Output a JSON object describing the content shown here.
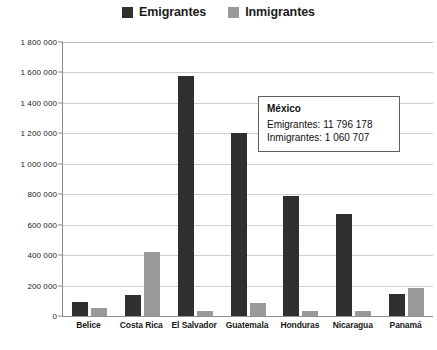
{
  "legend": {
    "position": "top-center",
    "entries": [
      {
        "label": "Emigrantes",
        "color": "#2f2f2f",
        "swatch_name": "legend-swatch-emigrantes"
      },
      {
        "label": "Inmigrantes",
        "color": "#9a9a9a",
        "swatch_name": "legend-swatch-inmigrantes"
      }
    ]
  },
  "annotation": {
    "title": "México",
    "emigrantes": "Emigrantes: 11 796 178",
    "inmigrantes": "Inmigrantes: 1 060 707"
  },
  "axis": {
    "ticks": [
      "1 800 000",
      "1 600 000",
      "1 400 000",
      "1 200 000",
      "1 000 000",
      "800 000",
      "600 000",
      "400 000",
      "200 000",
      "0"
    ]
  },
  "chart_data": {
    "type": "bar",
    "title": "",
    "subtitle": "",
    "xlabel": "",
    "ylabel": "",
    "ylim": [
      0,
      1800000
    ],
    "ytick_step": 200000,
    "grid": true,
    "legend_position": "top-center",
    "categories": [
      "Belice",
      "Costa Rica",
      "El Salvador",
      "Guatemala",
      "Honduras",
      "Nicaragua",
      "Panamá"
    ],
    "series": [
      {
        "name": "Emigrantes",
        "color": "#2f2f2f",
        "values": [
          90000,
          140000,
          1580000,
          1200000,
          790000,
          670000,
          145000
        ]
      },
      {
        "name": "Inmigrantes",
        "color": "#9a9a9a",
        "values": [
          55000,
          420000,
          35000,
          85000,
          30000,
          35000,
          185000
        ]
      }
    ],
    "annotations": [
      {
        "label": "México",
        "Emigrantes": 11796178,
        "Inmigrantes": 1060707
      }
    ]
  }
}
